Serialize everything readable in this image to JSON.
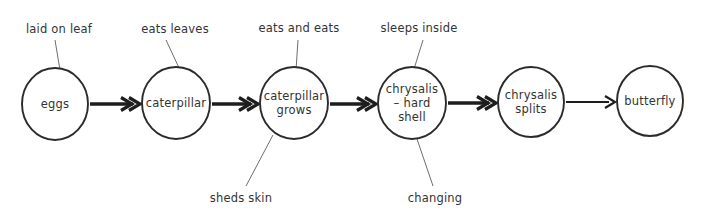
{
  "diagram": {
    "colors": {
      "background": "#ffffff",
      "node_stroke": "#2b2b2b",
      "text": "#333333",
      "arrow": "#1d1d1d",
      "leader_line": "#6e6e6e"
    },
    "nodes": [
      {
        "id": "eggs",
        "label_lines": [
          "eggs"
        ],
        "cx": 55,
        "cy": 104,
        "rx": 33,
        "ry": 36
      },
      {
        "id": "caterpillar",
        "label_lines": [
          "caterpillar"
        ],
        "cx": 176,
        "cy": 103,
        "rx": 34,
        "ry": 36
      },
      {
        "id": "caterpillar-grows",
        "label_lines": [
          "caterpillar",
          "grows"
        ],
        "cx": 294,
        "cy": 103,
        "rx": 34,
        "ry": 36
      },
      {
        "id": "chrysalis-hard-shell",
        "label_lines": [
          "chrysalis",
          "– hard",
          "shell"
        ],
        "cx": 412,
        "cy": 103,
        "rx": 34,
        "ry": 36
      },
      {
        "id": "chrysalis-splits",
        "label_lines": [
          "chrysalis",
          "splits"
        ],
        "cx": 531,
        "cy": 102,
        "rx": 33,
        "ry": 35
      },
      {
        "id": "butterfly",
        "label_lines": [
          "butterfly"
        ],
        "cx": 650,
        "cy": 101,
        "rx": 33,
        "ry": 35
      }
    ],
    "arrows": [
      {
        "id": "arrow-eggs-to-caterpillar",
        "from": "eggs",
        "to": "caterpillar",
        "x1": 90,
        "x2": 140,
        "y": 104,
        "weight": "thick"
      },
      {
        "id": "arrow-caterpillar-to-grows",
        "from": "caterpillar",
        "to": "caterpillar-grows",
        "x1": 212,
        "x2": 258,
        "y": 104,
        "weight": "thick"
      },
      {
        "id": "arrow-grows-to-chrysalis",
        "from": "caterpillar-grows",
        "to": "chrysalis-hard-shell",
        "x1": 330,
        "x2": 376,
        "y": 104,
        "weight": "thick"
      },
      {
        "id": "arrow-chrysalis-to-splits",
        "from": "chrysalis-hard-shell",
        "to": "chrysalis-splits",
        "x1": 448,
        "x2": 496,
        "y": 103,
        "weight": "thick"
      },
      {
        "id": "arrow-splits-to-butterfly",
        "from": "chrysalis-splits",
        "to": "butterfly",
        "x1": 566,
        "x2": 615,
        "y": 102,
        "weight": "thin"
      }
    ],
    "annotations": [
      {
        "id": "laid-on-leaf",
        "text": "laid on leaf",
        "tx": 59,
        "ty": 29,
        "line": {
          "x1": 55,
          "y1": 40,
          "x2": 60,
          "y2": 70
        },
        "attached_to": "eggs"
      },
      {
        "id": "eats-leaves",
        "text": "eats leaves",
        "tx": 175,
        "ty": 29,
        "line": {
          "x1": 166,
          "y1": 40,
          "x2": 180,
          "y2": 70
        },
        "attached_to": "caterpillar"
      },
      {
        "id": "eats-and-eats",
        "text": "eats and eats",
        "tx": 299,
        "ty": 28,
        "line": {
          "x1": 298,
          "y1": 40,
          "x2": 296,
          "y2": 70
        },
        "attached_to": "caterpillar-grows"
      },
      {
        "id": "sleeps-inside",
        "text": "sleeps inside",
        "tx": 419,
        "ty": 28,
        "line": {
          "x1": 423,
          "y1": 40,
          "x2": 414,
          "y2": 69
        },
        "attached_to": "chrysalis-hard-shell"
      },
      {
        "id": "sheds-skin",
        "text": "sheds skin",
        "tx": 241,
        "ty": 198,
        "line": {
          "x1": 273,
          "y1": 135,
          "x2": 246,
          "y2": 186
        },
        "attached_to": "caterpillar-grows"
      },
      {
        "id": "changing",
        "text": "changing",
        "tx": 435,
        "ty": 198,
        "line": {
          "x1": 416,
          "y1": 136,
          "x2": 433,
          "y2": 186
        },
        "attached_to": "chrysalis-hard-shell"
      }
    ]
  }
}
